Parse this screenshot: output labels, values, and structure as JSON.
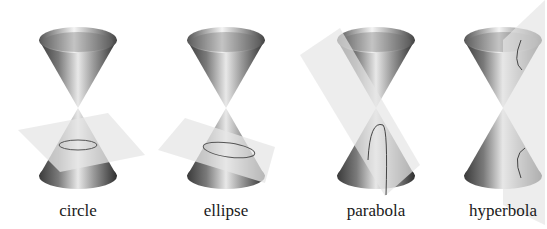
{
  "figure": {
    "panels": [
      {
        "id": "circle",
        "label": "circle",
        "center_x": 78
      },
      {
        "id": "ellipse",
        "label": "ellipse",
        "center_x": 226
      },
      {
        "id": "parabola",
        "label": "parabola",
        "center_x": 376
      },
      {
        "id": "hyperbola",
        "label": "hyperbola",
        "center_x": 503
      }
    ]
  }
}
